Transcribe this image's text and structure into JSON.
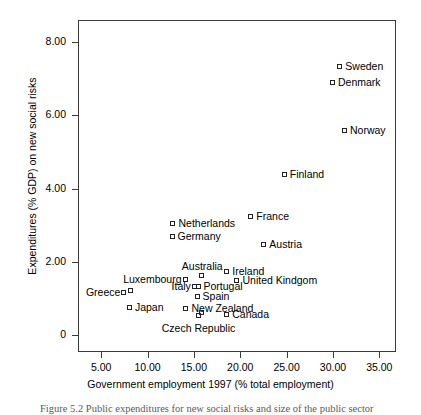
{
  "figure": {
    "caption": "Figure 5.2 Public expenditures for new social risks and size of the public sector"
  },
  "chart_data": {
    "type": "scatter",
    "title": "",
    "xlabel": "Government employment 1997 (% total employment)",
    "ylabel": "Expenditures (% GDP) on new social risks",
    "xlim": [
      2.5,
      36.8
    ],
    "ylim": [
      -0.45,
      8.6
    ],
    "xticks": [
      "5.00",
      "10.00",
      "15.00",
      "20.00",
      "25.00",
      "30.00",
      "35.00"
    ],
    "xtick_values": [
      5,
      10,
      15,
      20,
      25,
      30,
      35
    ],
    "yticks": [
      "8.00",
      "6.00",
      "4.00",
      "2.00",
      "0"
    ],
    "ytick_values": [
      8,
      6,
      4,
      2,
      0
    ],
    "grid": false,
    "legend": "none",
    "marker": "open-square",
    "marker_color": "#222222",
    "points": [
      {
        "label": "Sweden",
        "x": 30.8,
        "y": 7.32,
        "side": "right"
      },
      {
        "label": "Denmark",
        "x": 30.0,
        "y": 6.87,
        "side": "right"
      },
      {
        "label": "Norway",
        "x": 31.3,
        "y": 5.57,
        "side": "right"
      },
      {
        "label": "Finland",
        "x": 24.8,
        "y": 4.37,
        "side": "right"
      },
      {
        "label": "France",
        "x": 21.2,
        "y": 3.22,
        "side": "right"
      },
      {
        "label": "Netherlands",
        "x": 12.8,
        "y": 3.03,
        "side": "right"
      },
      {
        "label": "Germany",
        "x": 12.7,
        "y": 2.68,
        "side": "right"
      },
      {
        "label": "Austria",
        "x": 22.6,
        "y": 2.46,
        "side": "right"
      },
      {
        "label": "Ireland",
        "x": 18.6,
        "y": 1.72,
        "side": "right"
      },
      {
        "label": "Australia",
        "x": 15.9,
        "y": 1.62,
        "side": "above"
      },
      {
        "label": "United Kindgom",
        "x": 19.7,
        "y": 1.48,
        "side": "right"
      },
      {
        "label": "Luxembourg",
        "x": 14.1,
        "y": 1.52,
        "side": "left"
      },
      {
        "label": "Portugal",
        "x": 15.5,
        "y": 1.33,
        "side": "right"
      },
      {
        "label": "Italy",
        "x": 15.1,
        "y": 1.32,
        "side": "left"
      },
      {
        "label": "Greece",
        "x": 7.5,
        "y": 1.15,
        "side": "left"
      },
      {
        "label": "",
        "x": 8.2,
        "y": 1.2,
        "side": "none"
      },
      {
        "label": "Spain",
        "x": 15.4,
        "y": 1.06,
        "side": "right"
      },
      {
        "label": "Japan",
        "x": 8.1,
        "y": 0.75,
        "side": "right"
      },
      {
        "label": "New Zealand",
        "x": 14.2,
        "y": 0.72,
        "side": "right"
      },
      {
        "label": "Canada",
        "x": 18.6,
        "y": 0.55,
        "side": "right"
      },
      {
        "label": "Czech Republic",
        "x": 15.5,
        "y": 0.52,
        "side": "below"
      },
      {
        "label": "",
        "x": 15.9,
        "y": 0.62,
        "side": "none"
      }
    ]
  }
}
